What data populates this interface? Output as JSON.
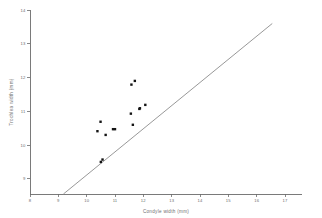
{
  "chart_data": {
    "type": "scatter",
    "title": "",
    "xlabel": "Condyle  width  (mm)",
    "ylabel": "Trochlea  width  (mm)",
    "xlim": [
      8,
      17.6
    ],
    "ylim": [
      8.55,
      14
    ],
    "xticks": [
      8,
      9,
      10,
      11,
      12,
      13,
      14,
      15,
      16,
      17
    ],
    "yticks": [
      9,
      10,
      11,
      12,
      13,
      14
    ],
    "xtick_labels": [
      "8",
      "9",
      "10",
      "11",
      "12",
      "13",
      "14",
      "15",
      "16",
      "17"
    ],
    "ytick_labels": [
      "9",
      "10",
      "11",
      "12",
      "13",
      "14"
    ],
    "grid": false,
    "legend": null,
    "series": [
      {
        "name": "specimens",
        "marker": "square",
        "color": "#141414",
        "points": [
          {
            "x": 10.38,
            "y": 10.41
          },
          {
            "x": 10.49,
            "y": 10.69
          },
          {
            "x": 10.5,
            "y": 9.5
          },
          {
            "x": 10.56,
            "y": 9.57
          },
          {
            "x": 10.67,
            "y": 10.3
          },
          {
            "x": 10.93,
            "y": 10.47
          },
          {
            "x": 11.0,
            "y": 10.47
          },
          {
            "x": 11.56,
            "y": 10.93
          },
          {
            "x": 11.58,
            "y": 11.79
          },
          {
            "x": 11.63,
            "y": 10.6
          },
          {
            "x": 11.7,
            "y": 11.9
          },
          {
            "x": 11.86,
            "y": 11.07
          },
          {
            "x": 11.88,
            "y": 11.09
          },
          {
            "x": 12.07,
            "y": 11.19
          }
        ]
      }
    ],
    "reference_line": {
      "name": "identity-line",
      "type": "line",
      "color": "#8c8c8c",
      "x_start": 9.18,
      "y_start": 8.55,
      "x_end": 16.55,
      "y_end": 13.6
    }
  }
}
